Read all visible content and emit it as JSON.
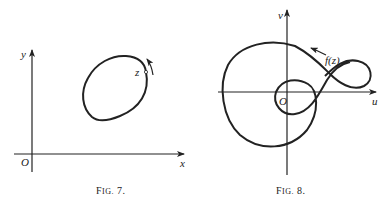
{
  "figure7": {
    "caption_prefix": "F",
    "caption_small": "IG.",
    "caption_number": "7.",
    "x_axis_label": "x",
    "y_axis_label": "y",
    "origin_label": "O",
    "point_label": "z"
  },
  "figure8": {
    "caption_prefix": "F",
    "caption_small": "IG.",
    "caption_number": "8.",
    "u_axis_label": "u",
    "v_axis_label": "v",
    "origin_label": "O",
    "curve_label": "f(z)"
  },
  "colors": {
    "ink": "#222222",
    "background": "#ffffff"
  }
}
